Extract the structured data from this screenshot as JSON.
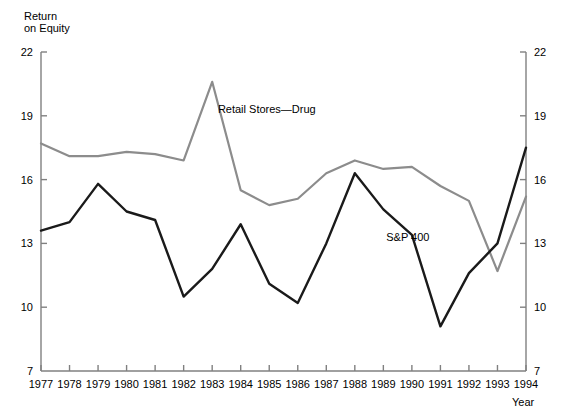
{
  "chart_data": {
    "type": "line",
    "title": "",
    "xlabel": "Year",
    "ylabel": "Return\non Equity",
    "x": [
      1977,
      1978,
      1979,
      1980,
      1981,
      1982,
      1983,
      1984,
      1985,
      1986,
      1987,
      1988,
      1989,
      1990,
      1991,
      1992,
      1993,
      1994
    ],
    "categories": [
      "1977",
      "1978",
      "1979",
      "1980",
      "1981",
      "1982",
      "1983",
      "1984",
      "1985",
      "1986",
      "1987",
      "1988",
      "1989",
      "1990",
      "1991",
      "1992",
      "1993",
      "1994"
    ],
    "ylim": [
      7,
      22
    ],
    "yticks": [
      7,
      10,
      13,
      16,
      19,
      22
    ],
    "ytick_labels_left": [
      "7",
      "10",
      "13",
      "16",
      "19",
      "22"
    ],
    "ytick_labels_right": [
      "7",
      "10",
      "13",
      "16",
      "19",
      "22"
    ],
    "grid": false,
    "legend": "inline-labels",
    "series": [
      {
        "name": "Retail Stores—Drug",
        "color": "#8c8c8c",
        "label_x": 1983.2,
        "label_y": 19.3,
        "values": [
          17.7,
          17.1,
          17.1,
          17.3,
          17.2,
          16.9,
          20.6,
          15.5,
          14.8,
          15.1,
          16.3,
          16.9,
          16.5,
          16.6,
          15.7,
          15.0,
          11.7,
          15.2
        ]
      },
      {
        "name": "S&P 400",
        "color": "#1a1a1a",
        "label_x": 1989.1,
        "label_y": 13.3,
        "values": [
          13.6,
          14.0,
          15.8,
          14.5,
          14.1,
          10.5,
          11.8,
          13.9,
          11.1,
          10.2,
          13.0,
          16.3,
          14.6,
          13.4,
          9.1,
          11.6,
          13.0,
          17.5
        ]
      }
    ]
  },
  "axis": {
    "y_title": "Return\non Equity",
    "x_title": "Year"
  }
}
